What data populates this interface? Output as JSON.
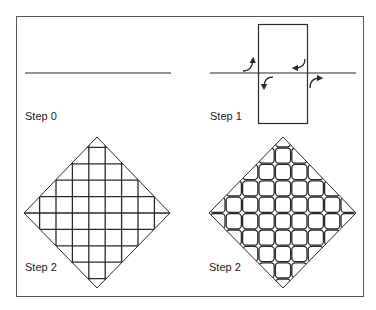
{
  "colors": {
    "background": "#ffffff",
    "stroke": "#2a2a2a",
    "frame": "#555555"
  },
  "panels": [
    {
      "id": "step0",
      "label": "Step 0",
      "description": "single horizontal line"
    },
    {
      "id": "step1",
      "label": "Step 1",
      "description": "horizontal line crossed by rectangle with four curved arrows"
    },
    {
      "id": "step2a",
      "label": "Step 2",
      "description": "diamond with straight crossing grid lines"
    },
    {
      "id": "step2b",
      "label": "Step 2",
      "description": "diamond with rounded-square grid cells"
    }
  ],
  "arrows": [
    {
      "name": "arrow-up-left",
      "direction": "up"
    },
    {
      "name": "arrow-left-top-right",
      "direction": "left"
    },
    {
      "name": "arrow-down-left",
      "direction": "down"
    },
    {
      "name": "arrow-right-bottom-right",
      "direction": "right"
    }
  ]
}
